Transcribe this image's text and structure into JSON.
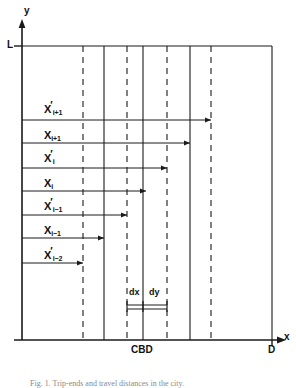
{
  "figure": {
    "title_axis_y": "y",
    "title_axis_x": "x",
    "corner_label": "L",
    "origin_right_label": "D",
    "center_label": "CBD",
    "dx_label": "dx",
    "dy_label": "dy",
    "caption": "Fig. 1. Trip-ends and travel distances in the city."
  },
  "chart_data": {
    "type": "diagram",
    "title": "",
    "xlabel": "x",
    "ylabel": "y",
    "xlim": [
      0,
      250
    ],
    "ylim": [
      0,
      310
    ],
    "grid": false,
    "legend": "none",
    "axes": {
      "x_axis_y_px": 340,
      "y_axis_x_px": 22,
      "plot_left_px": 22,
      "plot_right_px": 272,
      "plot_top_px": 46,
      "plot_bottom_px": 340
    },
    "annotations": [
      {
        "name": "y-axis-arrow-label",
        "text": "y",
        "x_px": 26,
        "y_px": 12
      },
      {
        "name": "x-axis-arrow-label",
        "text": "x",
        "x_px": 285,
        "y_px": 340
      },
      {
        "name": "top-left-corner-label",
        "text": "L",
        "x_px": 11,
        "y_px": 46
      },
      {
        "name": "right-end-label",
        "text": "D",
        "x_px": 272,
        "y_px": 352
      },
      {
        "name": "cbd-label",
        "text": "CBD",
        "x_px": 143,
        "y_px": 352
      }
    ],
    "vertical_lines": [
      {
        "name": "zone-boundary-1",
        "x_px": 83,
        "style": "dashed"
      },
      {
        "name": "zone-boundary-2",
        "x_px": 104,
        "style": "solid"
      },
      {
        "name": "zone-boundary-3",
        "x_px": 127,
        "style": "dashed"
      },
      {
        "name": "zone-boundary-4",
        "x_px": 143,
        "style": "solid"
      },
      {
        "name": "zone-boundary-5",
        "x_px": 167,
        "style": "dashed"
      },
      {
        "name": "zone-boundary-6",
        "x_px": 190,
        "style": "solid"
      },
      {
        "name": "zone-boundary-7",
        "x_px": 211,
        "style": "dashed"
      }
    ],
    "series": [
      {
        "name": "X'_{i+1}",
        "label_html": "X<span class=\"prime\">&prime;</span><sub>i+1</sub>",
        "label_x_px": 44,
        "label_y_px": 104,
        "arrow_y_px": 120,
        "arrow_start_px": 22,
        "arrow_end_px": 211
      },
      {
        "name": "X_{i+1}",
        "label_html": "X<sub>i+1</sub>",
        "label_x_px": 44,
        "label_y_px": 130,
        "arrow_y_px": 143,
        "arrow_start_px": 22,
        "arrow_end_px": 190
      },
      {
        "name": "X'_{i}",
        "label_html": "X<span class=\"prime\">&prime;</span><sub>i</sub>",
        "label_x_px": 44,
        "label_y_px": 153,
        "arrow_y_px": 168,
        "arrow_start_px": 22,
        "arrow_end_px": 167
      },
      {
        "name": "X_{i}",
        "label_html": "X<sub>i</sub>",
        "label_x_px": 44,
        "label_y_px": 178,
        "arrow_y_px": 191,
        "arrow_start_px": 22,
        "arrow_end_px": 146
      },
      {
        "name": "X'_{i-1}",
        "label_html": "X<span class=\"prime\">&prime;</span><sub>i&minus;1</sub>",
        "label_x_px": 44,
        "label_y_px": 201,
        "arrow_y_px": 215,
        "arrow_start_px": 22,
        "arrow_end_px": 127
      },
      {
        "name": "X_{i-1}",
        "label_html": "X<sub>i&minus;1</sub>",
        "label_x_px": 44,
        "label_y_px": 225,
        "arrow_y_px": 238,
        "arrow_start_px": 22,
        "arrow_end_px": 104
      },
      {
        "name": "X'_{i-2}",
        "label_html": "X<span class=\"prime\">&prime;</span><sub>i&minus;2</sub>",
        "label_x_px": 44,
        "label_y_px": 250,
        "arrow_y_px": 263,
        "arrow_start_px": 22,
        "arrow_end_px": 83
      }
    ],
    "interval_markers": {
      "bar_y_px": 307,
      "dx": {
        "start_px": 127,
        "end_px": 143,
        "label": "dx",
        "label_x_px": 130,
        "label_y_px": 292
      },
      "dy": {
        "start_px": 143,
        "end_px": 167,
        "label": "dy",
        "label_x_px": 148,
        "label_y_px": 292
      }
    }
  }
}
